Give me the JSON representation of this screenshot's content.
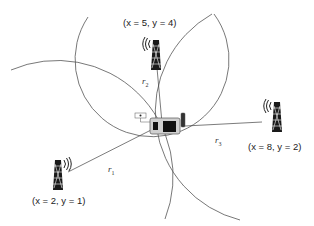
{
  "diagram": {
    "type": "trilateration",
    "towers": [
      {
        "id": "tower-1",
        "label": "(x = 2, y = 1)",
        "x_val": "2",
        "y_val": "1",
        "pos": [
          58,
          175
        ]
      },
      {
        "id": "tower-2",
        "label": "(x = 5, y = 4)",
        "x_val": "5",
        "y_val": "4",
        "pos": [
          155,
          50
        ]
      },
      {
        "id": "tower-3",
        "label": "(x = 8, y = 2)",
        "x_val": "8",
        "y_val": "2",
        "pos": [
          276,
          116
        ]
      }
    ],
    "radii": [
      {
        "label": "r",
        "sub": "1"
      },
      {
        "label": "r",
        "sub": "2"
      },
      {
        "label": "r",
        "sub": "3"
      }
    ],
    "device": {
      "name": "mobile-device",
      "pos": [
        163,
        126
      ]
    },
    "colors": {
      "line": "#444444",
      "tower": "#1a1a1a",
      "device_body": "#d0d0d0"
    }
  }
}
